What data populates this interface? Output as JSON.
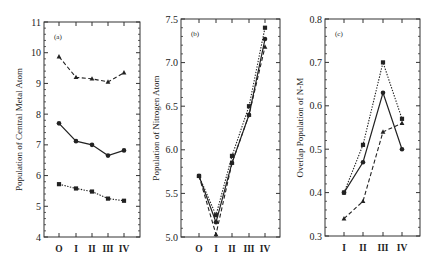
{
  "chart_data": [
    {
      "type": "line",
      "panel": "(a)",
      "ylabel": "Population of Central Metal Atom",
      "xlabel": "",
      "categories": [
        "O",
        "I",
        "II",
        "III",
        "IV"
      ],
      "ylim": [
        4,
        11
      ],
      "yticks": [
        4,
        5,
        6,
        7,
        8,
        9,
        10,
        11
      ],
      "series": [
        {
          "name": "triangle-dashed",
          "marker": "triangle",
          "style": "dashed",
          "values": [
            9.87,
            9.2,
            9.15,
            9.05,
            9.35
          ]
        },
        {
          "name": "circle-solid",
          "marker": "circle",
          "style": "solid",
          "values": [
            7.7,
            7.12,
            7.0,
            6.65,
            6.82
          ]
        },
        {
          "name": "square-dotted",
          "marker": "square",
          "style": "dotted",
          "values": [
            5.72,
            5.58,
            5.48,
            5.25,
            5.18
          ]
        }
      ],
      "grid": false
    },
    {
      "type": "line",
      "panel": "(b)",
      "ylabel": "Population of Nitrogen Atom",
      "xlabel": "",
      "categories": [
        "O",
        "I",
        "II",
        "III",
        "IV"
      ],
      "ylim": [
        5.0,
        7.5
      ],
      "yticks": [
        "5.0",
        "5.5",
        "6.0",
        "6.5",
        "7.0",
        "7.5"
      ],
      "series": [
        {
          "name": "square-dotted",
          "marker": "square",
          "style": "dotted",
          "values": [
            5.7,
            5.25,
            5.93,
            6.5,
            7.4
          ]
        },
        {
          "name": "circle-solid",
          "marker": "circle",
          "style": "solid",
          "values": [
            5.7,
            5.17,
            5.85,
            6.4,
            7.27
          ]
        },
        {
          "name": "triangle-dashed",
          "marker": "triangle",
          "style": "dashed",
          "values": [
            5.7,
            5.03,
            5.85,
            6.4,
            7.18
          ]
        }
      ],
      "grid": false
    },
    {
      "type": "line",
      "panel": "(c)",
      "ylabel": "Overlap Population of N-M",
      "xlabel": "",
      "categories": [
        "I",
        "II",
        "III",
        "IV"
      ],
      "ylim": [
        0.3,
        0.8
      ],
      "yticks": [
        "0.3",
        "0.4",
        "0.5",
        "0.6",
        "0.7",
        "0.8"
      ],
      "series": [
        {
          "name": "square-dotted",
          "marker": "square",
          "style": "dotted",
          "values": [
            0.4,
            0.51,
            0.7,
            0.57
          ]
        },
        {
          "name": "circle-solid",
          "marker": "circle",
          "style": "solid",
          "values": [
            0.4,
            0.47,
            0.63,
            0.5
          ]
        },
        {
          "name": "triangle-dashed",
          "marker": "triangle",
          "style": "dashed",
          "values": [
            0.34,
            0.38,
            0.54,
            0.56
          ]
        }
      ],
      "grid": false
    }
  ],
  "layout": [
    {
      "left": 44,
      "right": 140,
      "top": 22,
      "bottom": 237,
      "cat_x": [
        59,
        76,
        92,
        108,
        124
      ],
      "minor_per_major": 5
    },
    {
      "left": 181,
      "right": 280,
      "top": 19,
      "bottom": 237,
      "cat_x": [
        199,
        216,
        232,
        249,
        265
      ],
      "minor_per_major": 5
    },
    {
      "left": 325,
      "right": 420,
      "top": 19,
      "bottom": 236,
      "cat_x": [
        344,
        363,
        383,
        402
      ],
      "minor_per_major": 5
    }
  ]
}
